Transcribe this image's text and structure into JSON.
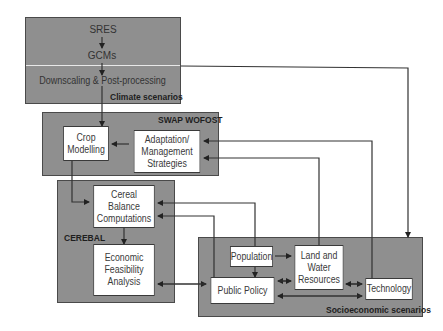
{
  "groups": {
    "climate": {
      "label": "Climate scenarios",
      "items": [
        "SRES",
        "GCMs",
        "Downscaling & Post-processing"
      ]
    },
    "swap": {
      "label": "SWAP WOFOST"
    },
    "cerebal": {
      "label": "CEREBAL"
    },
    "socio": {
      "label": "Socioeconomic scenarios"
    }
  },
  "nodes": {
    "crop_modelling": {
      "line1": "Crop",
      "line2": "Modelling"
    },
    "adaptation": {
      "line1": "Adaptation/",
      "line2": "Management",
      "line3": "Strategies"
    },
    "cereal_balance": {
      "line1": "Cereal Balance",
      "line2": "Computations"
    },
    "economic": {
      "line1": "Economic",
      "line2": "Feasibility",
      "line3": "Analysis"
    },
    "population": {
      "line1": "Population"
    },
    "land_water": {
      "line1": "Land and",
      "line2": "Water",
      "line3": "Resources"
    },
    "public_policy": {
      "line1": "Public Policy"
    },
    "technology": {
      "line1": "Technology"
    }
  },
  "colors": {
    "group_fill": "#8f8f8f",
    "border": "#3a3a3a",
    "node_fill": "#ffffff"
  }
}
